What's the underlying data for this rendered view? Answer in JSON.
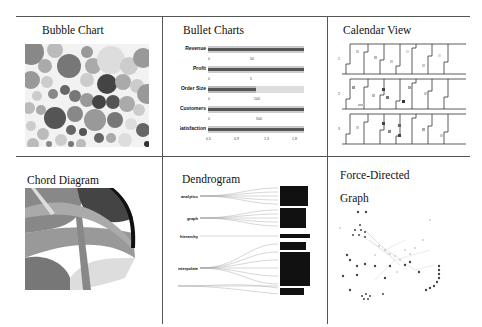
{
  "grid": {
    "rows": 2,
    "cols": 3,
    "cells": [
      {
        "title": "Bubble Chart"
      },
      {
        "title": "Bullet Charts"
      },
      {
        "title": "Calendar View"
      },
      {
        "title": "Chord Diagram"
      },
      {
        "title": "Dendrogram"
      },
      {
        "title": "Force-Directed",
        "title2": "Graph"
      }
    ]
  },
  "bullet": {
    "rows": [
      {
        "label": "Revenue",
        "sub": "U.S. $, in thousands",
        "measure": 1.0,
        "ticks": [
          "0",
          "50",
          "1"
        ]
      },
      {
        "label": "Profit",
        "sub": "%",
        "measure": 1.0,
        "ticks": [
          "0",
          "5"
        ]
      },
      {
        "label": "Order Size",
        "sub": "U.S. $, average",
        "measure": 0.5,
        "ticks": [
          "0",
          "100",
          "0"
        ]
      },
      {
        "label": "Customers",
        "sub": "count",
        "measure": 1.0,
        "ticks": [
          "0",
          "500"
        ]
      },
      {
        "label": "Satisfaction",
        "sub": "out of 5",
        "measure": 1.0,
        "ticks": [
          "0.5",
          "0.9",
          "1.3",
          "1.8"
        ]
      }
    ]
  },
  "calendar": {
    "years": [
      "1",
      "2",
      "3"
    ]
  },
  "colors": {
    "rule": "#555555",
    "dark": "#333333",
    "mid": "#777777",
    "light": "#bbbbbb",
    "pale": "#dddddd"
  }
}
